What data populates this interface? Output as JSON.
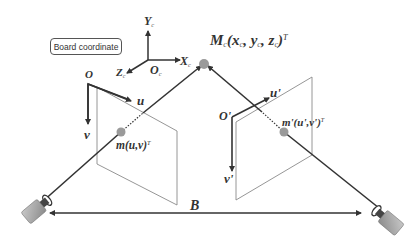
{
  "diagram": {
    "type": "stereo-camera-geometry",
    "board_label": "Board coordinate",
    "board_axes": {
      "y": {
        "main": "Y",
        "sub": "c"
      },
      "x": {
        "main": "X",
        "sub": "c"
      },
      "z": {
        "main": "Z",
        "sub": "c"
      },
      "origin": {
        "main": "O",
        "sub": "c"
      }
    },
    "world_point": {
      "main": "M",
      "sub": "c",
      "coords": "(x",
      "x_sub": "c",
      "sep1": ", y",
      "y_sub": "c",
      "sep2": ", z",
      "z_sub": "c",
      "close": ")",
      "sup": "T"
    },
    "left_image": {
      "origin": "O",
      "u": "u",
      "v": "v",
      "point": "m(u,v)",
      "point_sup": "T"
    },
    "right_image": {
      "origin": "O'",
      "u": "u'",
      "v": "v'",
      "point": "m'(u',v')",
      "point_sup": "T"
    },
    "baseline": "B",
    "colors": {
      "line": "#333333",
      "plane": "#8a8a8a",
      "point": "#9a9a9a",
      "camera_body": "#a8a8a8"
    }
  }
}
